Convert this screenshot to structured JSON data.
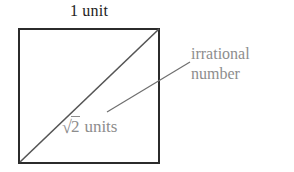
{
  "diagram": {
    "title_label": "1 unit",
    "square": {
      "name": "unit-square",
      "side_label": "1 unit",
      "border_color": "#2b2b2b",
      "fill_color": "#ffffff"
    },
    "diagonal": {
      "name": "diagonal-line",
      "label_radical_sign": "√",
      "label_radicand": "2",
      "label_units": "units",
      "label_full": "√2 units",
      "color": "#555555"
    },
    "callout": {
      "name": "irrational-number-callout",
      "line1": "irrational",
      "line2": "number",
      "color": "#8d8d8d",
      "leader_line_color": "#6f6f6f"
    }
  }
}
